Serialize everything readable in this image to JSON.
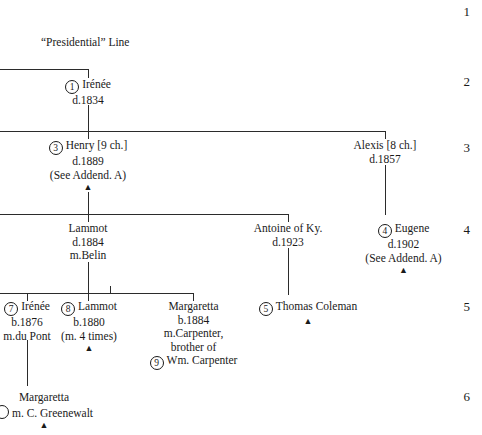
{
  "chart": {
    "title": "“Presidential” Line",
    "generation_numbers": [
      "1",
      "2",
      "3",
      "4",
      "5",
      "6"
    ],
    "descendant_marker": "▲"
  },
  "nodes": {
    "irenee_1": {
      "key": "1",
      "name": "Irénée",
      "death": "d.1834"
    },
    "henry_3": {
      "key": "3",
      "name": "Henry [9 ch.]",
      "death": "d.1889",
      "note": "(See Addend. A)"
    },
    "alexis": {
      "name": "Alexis [8 ch.]",
      "death": "d.1857"
    },
    "lammot": {
      "name": "Lammot",
      "death": "d.1884",
      "marriage": "m.Belin"
    },
    "antoine": {
      "name": "Antoine of Ky.",
      "death": "d.1923"
    },
    "eugene_4": {
      "key": "4",
      "name": "Eugene",
      "death": "d.1902",
      "note": "(See Addend. A)"
    },
    "irenee_7": {
      "key": "7",
      "name": "Irénée",
      "birth": "b.1876",
      "marriage": "m.du Pont"
    },
    "lammot_8": {
      "key": "8",
      "name": "Lammot",
      "birth": "b.1880",
      "marriage": "(m. 4 times)"
    },
    "margaretta_1884": {
      "name": "Margaretta",
      "birth": "b.1884",
      "marriage": "m.Carpenter,",
      "relation": "brother of",
      "spouse_key": "9",
      "spouse": "Wm. Carpenter"
    },
    "thomas_coleman_5": {
      "key": "5",
      "name": "Thomas Coleman"
    },
    "margaretta_greenewalt": {
      "name": "Margaretta",
      "marriage": "m. C. Greenewalt"
    }
  }
}
